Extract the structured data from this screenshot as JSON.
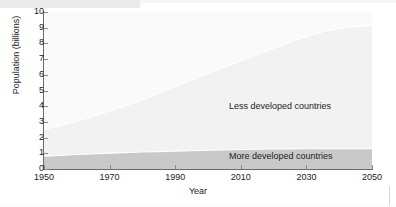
{
  "chart_data": {
    "type": "area",
    "stacked": true,
    "title": "",
    "xlabel": "Year",
    "ylabel": "Population (billions)",
    "xlim": [
      1950,
      2050
    ],
    "ylim": [
      0,
      10
    ],
    "ytick_interval": 1,
    "xtick_interval": 20,
    "grid": false,
    "legend_position": "in-plot annotations",
    "x": [
      1950,
      1960,
      1970,
      1980,
      1990,
      2000,
      2010,
      2020,
      2030,
      2040,
      2050
    ],
    "xticks": [
      "1950",
      "1970",
      "1990",
      "2010",
      "2030",
      "2050"
    ],
    "yticks": [
      "0",
      "1",
      "2",
      "3",
      "4",
      "5",
      "6",
      "7",
      "8",
      "9",
      "10"
    ],
    "series": [
      {
        "name": "More developed countries",
        "color": "#c9c9c9",
        "values": [
          0.81,
          0.92,
          1.01,
          1.08,
          1.14,
          1.19,
          1.24,
          1.27,
          1.29,
          1.3,
          1.3
        ]
      },
      {
        "name": "Less developed countries",
        "color": "#f2f2f2",
        "values": [
          1.71,
          2.13,
          2.68,
          3.32,
          4.12,
          4.87,
          5.65,
          6.42,
          7.15,
          7.65,
          7.85
        ]
      }
    ],
    "totals": [
      2.52,
      3.05,
      3.69,
      4.4,
      5.26,
      6.06,
      6.89,
      7.69,
      8.44,
      8.95,
      9.15
    ],
    "annotations": [
      {
        "text": "Less developed countries",
        "x": 2018,
        "y": 4.3
      },
      {
        "text": "More developed countries",
        "x": 2018,
        "y": 0.9
      }
    ]
  },
  "colors": {
    "plot_background": "#fafafa",
    "axis": "#6b6b6b",
    "text": "#1c1c1c",
    "more_developed": "#c9c9c9",
    "less_developed": "#f2f2f2",
    "page_background": "#ffffff"
  }
}
